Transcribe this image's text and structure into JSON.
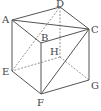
{
  "diagram": {
    "type": "cube",
    "stroke_color": "#555555",
    "dashed_color": "#777777",
    "vertices": {
      "A": {
        "label": "A",
        "x": 12,
        "y": 20,
        "lx": 2,
        "ly": 15
      },
      "B": {
        "label": "B",
        "x": 41,
        "y": 43,
        "lx": 41,
        "ly": 33
      },
      "C": {
        "label": "C",
        "x": 89,
        "y": 29,
        "lx": 91,
        "ly": 25
      },
      "D": {
        "label": "D",
        "x": 60,
        "y": 7,
        "lx": 56,
        "ly": -1
      },
      "E": {
        "label": "E",
        "x": 12,
        "y": 71,
        "lx": 2,
        "ly": 67
      },
      "F": {
        "label": "F",
        "x": 41,
        "y": 94,
        "lx": 37,
        "ly": 98
      },
      "G": {
        "label": "G",
        "x": 89,
        "y": 80,
        "lx": 91,
        "ly": 81
      },
      "H": {
        "label": "H",
        "x": 60,
        "y": 57,
        "lx": 50,
        "ly": 47
      }
    },
    "solid_edges": [
      [
        "A",
        "D"
      ],
      [
        "D",
        "C"
      ],
      [
        "A",
        "C"
      ],
      [
        "A",
        "B"
      ],
      [
        "B",
        "C"
      ],
      [
        "A",
        "E"
      ],
      [
        "B",
        "F"
      ],
      [
        "C",
        "G"
      ],
      [
        "E",
        "F"
      ],
      [
        "F",
        "G"
      ],
      [
        "C",
        "F"
      ]
    ],
    "dashed_edges": [
      [
        "D",
        "H"
      ],
      [
        "H",
        "E"
      ],
      [
        "H",
        "G"
      ],
      [
        "E",
        "D"
      ]
    ]
  }
}
